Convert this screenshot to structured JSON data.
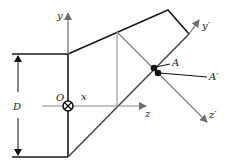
{
  "diagram": {
    "labels": {
      "y_axis": "y",
      "y_prime_axis": "y′",
      "z_axis": "z",
      "z_prime_axis": "z′",
      "x_axis": "x",
      "origin": "O",
      "point_a": "A",
      "point_a_prime": "A′",
      "dimension": "D"
    },
    "colors": {
      "outline": "#1a1a1a",
      "axis": "#7a7a7a",
      "text": "#222222"
    },
    "origin_symbol": "into-page (⊗)"
  }
}
